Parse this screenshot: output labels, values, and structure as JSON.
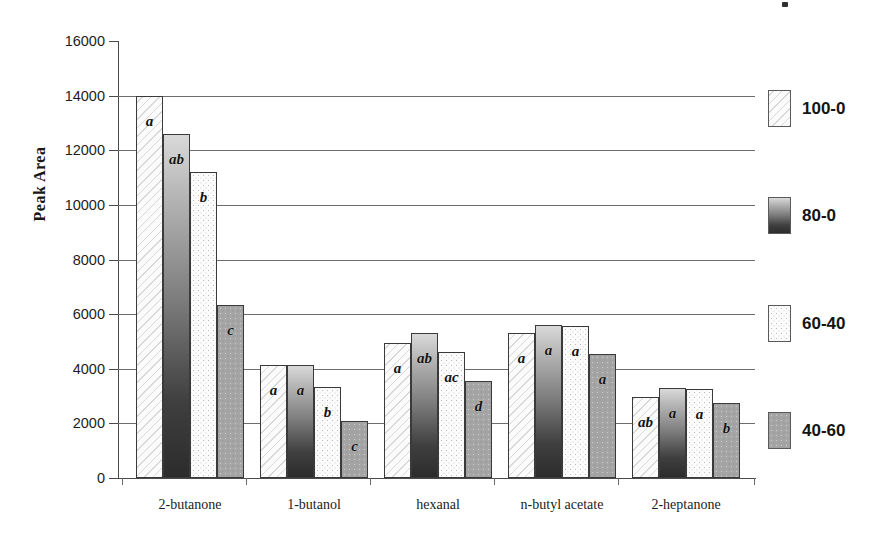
{
  "chart_data": {
    "type": "bar",
    "title": "",
    "xlabel": "",
    "ylabel": "Peak Area",
    "ylim": [
      0,
      16000
    ],
    "ytick_step": 2000,
    "yticks": [
      0,
      2000,
      4000,
      6000,
      8000,
      10000,
      12000,
      14000,
      16000
    ],
    "ytick_labels": [
      "0",
      "2000",
      "4000",
      "6000",
      "8000",
      "10000",
      "12000",
      "14000",
      "16000"
    ],
    "grid": "horizontal",
    "legend_position": "right",
    "categories": [
      "2-butanone",
      "1-butanol",
      "hexanal",
      "n-butyl acetate",
      "2-heptanone"
    ],
    "series": [
      {
        "name": "100-0",
        "pattern": "diagonal-hatch",
        "values": [
          14000,
          4150,
          4950,
          5300,
          2950
        ],
        "annotations": [
          "a",
          "a",
          "a",
          "a",
          "ab"
        ]
      },
      {
        "name": "80-0",
        "pattern": "vertical-gradient-dark",
        "values": [
          12600,
          4150,
          5300,
          5600,
          3300
        ],
        "annotations": [
          "ab",
          "a",
          "ab",
          "a",
          "a"
        ]
      },
      {
        "name": "60-40",
        "pattern": "light-speckle",
        "values": [
          11200,
          3350,
          4600,
          5550,
          3250
        ],
        "annotations": [
          "b",
          "b",
          "ac",
          "a",
          "a"
        ]
      },
      {
        "name": "40-60",
        "pattern": "gray-speckle",
        "values": [
          6350,
          2100,
          3550,
          4550,
          2750
        ],
        "annotations": [
          "c",
          "c",
          "d",
          "a",
          "b"
        ]
      }
    ]
  },
  "legend": {
    "items": [
      {
        "label": "100-0",
        "pattern": "diagonal-hatch"
      },
      {
        "label": "80-0",
        "pattern": "vertical-gradient-dark"
      },
      {
        "label": "60-40",
        "pattern": "light-speckle"
      },
      {
        "label": "40-60",
        "pattern": "gray-speckle"
      }
    ]
  },
  "colors": {
    "axis": "#4a4a4a",
    "gridline": "#6d6d6d",
    "text": "#1a1a1a",
    "background": "#ffffff"
  }
}
